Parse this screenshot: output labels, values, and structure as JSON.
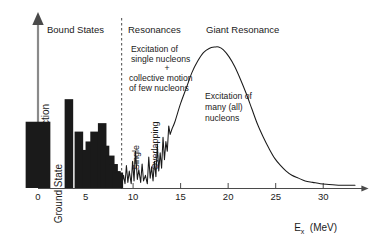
{
  "figure": {
    "title_implicit": "Nuclear cross-section versus excitation energy",
    "axis": {
      "y_label": "Cross–section",
      "y_origin_label": "Ground State",
      "x_label_symbol": "E",
      "x_label_sub": "x",
      "x_label_unit": "(MeV)"
    },
    "sections": [
      {
        "id": "bound-states",
        "label": "Bound States"
      },
      {
        "id": "resonances",
        "label": "Resonances"
      },
      {
        "id": "giant-resonance",
        "label": "Giant Resonance"
      }
    ],
    "annotations": [
      {
        "id": "resonance-mechanism-1",
        "text": "Excitation of"
      },
      {
        "id": "resonance-mechanism-2",
        "text": "single nucleons"
      },
      {
        "id": "resonance-mechanism-plus",
        "text": "+"
      },
      {
        "id": "resonance-mechanism-3",
        "text": "collective motion"
      },
      {
        "id": "resonance-mechanism-4",
        "text": "of few nucleons"
      },
      {
        "id": "giant-mechanism-1",
        "text": "Excitation of"
      },
      {
        "id": "giant-mechanism-2",
        "text": "many (all)"
      },
      {
        "id": "giant-mechanism-3",
        "text": "nucleons"
      }
    ],
    "inline_labels": [
      {
        "id": "single-label",
        "text": "Single"
      },
      {
        "id": "overlapping-label",
        "text": "Overlapping"
      }
    ],
    "colors": {
      "line": "#1a1a1a",
      "axis": "#7d7d7d",
      "background": "#ffffff",
      "dashed_divider": "#4a4a4a"
    }
  },
  "chart_data": {
    "type": "line",
    "title": "",
    "xlabel": "E_x (MeV)",
    "ylabel": "Cross-section",
    "xlim": [
      0,
      32.5
    ],
    "ylim": [
      0,
      1
    ],
    "grid": false,
    "legend_position": "none",
    "x_ticks": [
      0,
      5,
      10,
      15,
      20,
      25,
      30
    ],
    "x_tick_labels": [
      "0",
      "5",
      "10",
      "15",
      "20",
      "25",
      "30"
    ],
    "y_ticks": [],
    "y_tick_labels": [],
    "separator_x": 8.8,
    "series": [
      {
        "name": "Ground state and bound states (discrete lines)",
        "type": "bar",
        "x": [
          0.0,
          3.25,
          4.3,
          5.1,
          5.45,
          5.95,
          6.75,
          7.05,
          7.6,
          7.95,
          8.25,
          8.5
        ],
        "values": [
          0.47,
          0.63,
          0.4,
          0.27,
          0.33,
          0.4,
          0.46,
          0.3,
          0.23,
          0.17,
          0.12,
          0.11
        ],
        "widths": [
          2.6,
          0.9,
          0.9,
          0.9,
          0.9,
          0.9,
          0.9,
          0.9,
          0.9,
          0.9,
          0.9,
          0.9
        ]
      },
      {
        "name": "Resonance region (overlapping peaks) and giant resonance envelope",
        "type": "line",
        "x": [
          8.8,
          9.0,
          9.15,
          9.3,
          9.45,
          9.6,
          9.8,
          9.95,
          10.1,
          10.25,
          10.45,
          10.6,
          10.8,
          10.95,
          11.1,
          11.3,
          11.5,
          11.65,
          11.8,
          11.95,
          12.1,
          12.25,
          12.4,
          12.55,
          12.7,
          12.85,
          13.0,
          13.15,
          13.3,
          13.45,
          13.6,
          13.75,
          13.9,
          14.1,
          14.4,
          15.0,
          15.6,
          16.2,
          16.8,
          17.4,
          18.0,
          18.6,
          19.0,
          19.5,
          20.1,
          20.7,
          21.3,
          21.9,
          22.5,
          23.1,
          23.7,
          24.3,
          24.9,
          25.5,
          26.1,
          26.7,
          27.4,
          28.1,
          28.9,
          29.7,
          30.6,
          31.6
        ],
        "values": [
          0.02,
          0.09,
          0.03,
          0.16,
          0.04,
          0.12,
          0.03,
          0.19,
          0.05,
          0.26,
          0.06,
          0.13,
          0.04,
          0.17,
          0.05,
          0.09,
          0.03,
          0.22,
          0.07,
          0.15,
          0.05,
          0.19,
          0.08,
          0.31,
          0.12,
          0.25,
          0.14,
          0.36,
          0.2,
          0.33,
          0.26,
          0.44,
          0.38,
          0.42,
          0.47,
          0.6,
          0.71,
          0.82,
          0.9,
          0.96,
          0.99,
          1.0,
          1.0,
          0.98,
          0.93,
          0.86,
          0.77,
          0.67,
          0.56,
          0.45,
          0.36,
          0.28,
          0.21,
          0.16,
          0.12,
          0.09,
          0.07,
          0.05,
          0.04,
          0.03,
          0.025,
          0.02
        ]
      }
    ]
  }
}
